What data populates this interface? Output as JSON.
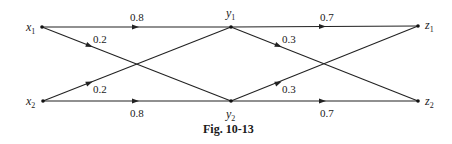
{
  "diagram": {
    "type": "channel-transition-graph",
    "caption": "Fig. 10-13",
    "nodes": [
      {
        "id": "x1",
        "var": "x",
        "sub": "1",
        "x": 42,
        "y": 27
      },
      {
        "id": "x2",
        "var": "x",
        "sub": "2",
        "x": 43,
        "y": 101
      },
      {
        "id": "y1",
        "var": "y",
        "sub": "1",
        "x": 231,
        "y": 27
      },
      {
        "id": "y2",
        "var": "y",
        "sub": "2",
        "x": 231,
        "y": 101
      },
      {
        "id": "z1",
        "var": "z",
        "sub": "1",
        "x": 418,
        "y": 26
      },
      {
        "id": "z2",
        "var": "z",
        "sub": "2",
        "x": 418,
        "y": 101
      }
    ],
    "edges": [
      {
        "from": "x1",
        "to": "y1",
        "label": "0.8"
      },
      {
        "from": "x1",
        "to": "y2",
        "label": "0.2"
      },
      {
        "from": "x2",
        "to": "y1",
        "label": "0.2"
      },
      {
        "from": "x2",
        "to": "y2",
        "label": "0.8"
      },
      {
        "from": "y1",
        "to": "z1",
        "label": "0.7"
      },
      {
        "from": "y1",
        "to": "z2",
        "label": "0.3"
      },
      {
        "from": "y2",
        "to": "z1",
        "label": "0.3"
      },
      {
        "from": "y2",
        "to": "z2",
        "label": "0.7"
      }
    ]
  }
}
